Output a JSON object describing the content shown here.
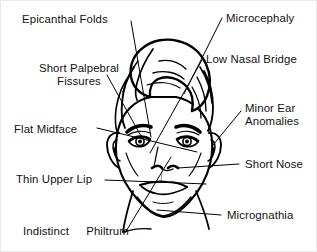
{
  "figure": {
    "line_color": "#000000",
    "background_color": "#ffffff",
    "border_color": "#e9e9e9"
  },
  "labels": {
    "epicanthal_folds": "Epicanthal  Folds",
    "short_palpebral_line1": "Short Palpebral",
    "short_palpebral_line2": "Fissures",
    "flat_midface": "Flat Midface",
    "thin_upper_lip": "Thin Upper Lip",
    "indistinct": "Indistinct",
    "philtrum": "Philtrum",
    "microcephaly": "Microcephaly",
    "low_nasal_bridge": "Low  Nasal Bridge",
    "minor_ear_line1": "Minor Ear",
    "minor_ear_line2": "Anomalies",
    "short_nose": "Short Nose",
    "micrognathia": "Micrognathia"
  }
}
